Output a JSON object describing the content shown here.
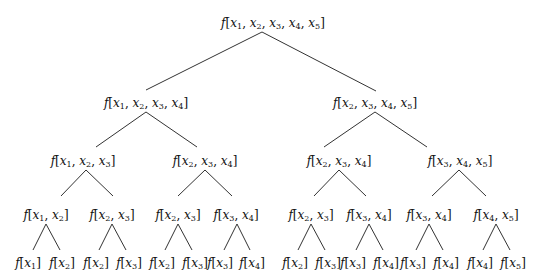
{
  "diagram": {
    "line_color": "#333333",
    "nodes": [
      {
        "id": "n0",
        "label": "f[x1, x2, x3, x4, x5]",
        "args": [
          1,
          2,
          3,
          4,
          5
        ],
        "x": 273,
        "y": 24
      },
      {
        "id": "n1",
        "label": "f[x1, x2, x3, x4]",
        "args": [
          1,
          2,
          3,
          4
        ],
        "x": 146,
        "y": 104
      },
      {
        "id": "n2",
        "label": "f[x2, x3, x4, x5]",
        "args": [
          2,
          3,
          4,
          5
        ],
        "x": 375,
        "y": 104
      },
      {
        "id": "n3",
        "label": "f[x1, x2, x3]",
        "args": [
          1,
          2,
          3
        ],
        "x": 83,
        "y": 162
      },
      {
        "id": "n4",
        "label": "f[x2, x3, x4]",
        "args": [
          2,
          3,
          4
        ],
        "x": 205,
        "y": 162
      },
      {
        "id": "n5",
        "label": "f[x2, x3, x4]",
        "args": [
          2,
          3,
          4
        ],
        "x": 339,
        "y": 162
      },
      {
        "id": "n6",
        "label": "f[x3, x4, x5]",
        "args": [
          3,
          4,
          5
        ],
        "x": 460,
        "y": 162
      },
      {
        "id": "n7",
        "label": "f[x1, x2]",
        "args": [
          1,
          2
        ],
        "x": 46,
        "y": 216
      },
      {
        "id": "n8",
        "label": "f[x2, x3]",
        "args": [
          2,
          3
        ],
        "x": 112,
        "y": 216
      },
      {
        "id": "n9",
        "label": "f[x2, x3]",
        "args": [
          2,
          3
        ],
        "x": 178,
        "y": 216
      },
      {
        "id": "n10",
        "label": "f[x3, x4]",
        "args": [
          3,
          4
        ],
        "x": 236,
        "y": 216
      },
      {
        "id": "n11",
        "label": "f[x2, x3]",
        "args": [
          2,
          3
        ],
        "x": 311,
        "y": 216
      },
      {
        "id": "n12",
        "label": "f[x3, x4]",
        "args": [
          3,
          4
        ],
        "x": 369,
        "y": 216
      },
      {
        "id": "n13",
        "label": "f[x3, x4]",
        "args": [
          3,
          4
        ],
        "x": 429,
        "y": 216
      },
      {
        "id": "n14",
        "label": "f[x4, x5]",
        "args": [
          4,
          5
        ],
        "x": 496,
        "y": 216
      },
      {
        "id": "l0",
        "label": "f[x1]",
        "args": [
          1
        ],
        "x": 28,
        "y": 264
      },
      {
        "id": "l1",
        "label": "f[x2]",
        "args": [
          2
        ],
        "x": 62,
        "y": 264
      },
      {
        "id": "l2",
        "label": "f[x2]",
        "args": [
          2
        ],
        "x": 96,
        "y": 264
      },
      {
        "id": "l3",
        "label": "f[x3]",
        "args": [
          3
        ],
        "x": 129,
        "y": 264
      },
      {
        "id": "l4",
        "label": "f[x2]",
        "args": [
          2
        ],
        "x": 162,
        "y": 264
      },
      {
        "id": "l5",
        "label": "f[x3]",
        "args": [
          3
        ],
        "x": 195,
        "y": 264
      },
      {
        "id": "l6",
        "label": "f[x3]",
        "args": [
          3
        ],
        "x": 220,
        "y": 264
      },
      {
        "id": "l7",
        "label": "f[x4]",
        "args": [
          4
        ],
        "x": 252,
        "y": 264
      },
      {
        "id": "l8",
        "label": "f[x2]",
        "args": [
          2
        ],
        "x": 295,
        "y": 264
      },
      {
        "id": "l9",
        "label": "f[x3]",
        "args": [
          3
        ],
        "x": 328,
        "y": 264
      },
      {
        "id": "l10",
        "label": "f[x3]",
        "args": [
          3
        ],
        "x": 353,
        "y": 264
      },
      {
        "id": "l11",
        "label": "f[x4]",
        "args": [
          4
        ],
        "x": 386,
        "y": 264
      },
      {
        "id": "l12",
        "label": "f[x3]",
        "args": [
          3
        ],
        "x": 413,
        "y": 264
      },
      {
        "id": "l13",
        "label": "f[x4]",
        "args": [
          4
        ],
        "x": 446,
        "y": 264
      },
      {
        "id": "l14",
        "label": "f[x4]",
        "args": [
          4
        ],
        "x": 480,
        "y": 264
      },
      {
        "id": "l15",
        "label": "f[x5]",
        "args": [
          5
        ],
        "x": 513,
        "y": 264
      }
    ],
    "edges": [
      {
        "x1": 262,
        "y1": 32,
        "x2": 146,
        "y2": 90
      },
      {
        "x1": 262,
        "y1": 32,
        "x2": 376,
        "y2": 91
      },
      {
        "x1": 146,
        "y1": 112,
        "x2": 96,
        "y2": 147
      },
      {
        "x1": 146,
        "y1": 112,
        "x2": 197,
        "y2": 147
      },
      {
        "x1": 375,
        "y1": 112,
        "x2": 324,
        "y2": 147
      },
      {
        "x1": 375,
        "y1": 112,
        "x2": 427,
        "y2": 147
      },
      {
        "x1": 86,
        "y1": 170,
        "x2": 61,
        "y2": 196
      },
      {
        "x1": 86,
        "y1": 170,
        "x2": 113,
        "y2": 196
      },
      {
        "x1": 205,
        "y1": 170,
        "x2": 178,
        "y2": 196
      },
      {
        "x1": 205,
        "y1": 170,
        "x2": 232,
        "y2": 196
      },
      {
        "x1": 339,
        "y1": 170,
        "x2": 314,
        "y2": 196
      },
      {
        "x1": 339,
        "y1": 170,
        "x2": 366,
        "y2": 196
      },
      {
        "x1": 459,
        "y1": 170,
        "x2": 432,
        "y2": 196
      },
      {
        "x1": 459,
        "y1": 170,
        "x2": 486,
        "y2": 196
      },
      {
        "x1": 46,
        "y1": 224,
        "x2": 33,
        "y2": 250
      },
      {
        "x1": 46,
        "y1": 224,
        "x2": 60,
        "y2": 250
      },
      {
        "x1": 112,
        "y1": 224,
        "x2": 99,
        "y2": 250
      },
      {
        "x1": 112,
        "y1": 224,
        "x2": 126,
        "y2": 250
      },
      {
        "x1": 178,
        "y1": 224,
        "x2": 165,
        "y2": 250
      },
      {
        "x1": 178,
        "y1": 224,
        "x2": 192,
        "y2": 250
      },
      {
        "x1": 237,
        "y1": 224,
        "x2": 224,
        "y2": 250
      },
      {
        "x1": 237,
        "y1": 224,
        "x2": 250,
        "y2": 250
      },
      {
        "x1": 311,
        "y1": 224,
        "x2": 298,
        "y2": 250
      },
      {
        "x1": 311,
        "y1": 224,
        "x2": 325,
        "y2": 250
      },
      {
        "x1": 369,
        "y1": 224,
        "x2": 356,
        "y2": 250
      },
      {
        "x1": 369,
        "y1": 224,
        "x2": 383,
        "y2": 250
      },
      {
        "x1": 429,
        "y1": 224,
        "x2": 416,
        "y2": 250
      },
      {
        "x1": 429,
        "y1": 224,
        "x2": 443,
        "y2": 250
      },
      {
        "x1": 496,
        "y1": 224,
        "x2": 483,
        "y2": 250
      },
      {
        "x1": 496,
        "y1": 224,
        "x2": 510,
        "y2": 250
      }
    ]
  }
}
